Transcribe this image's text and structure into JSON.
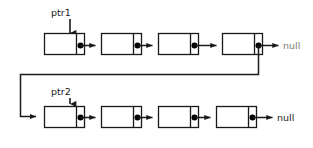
{
  "diagram": {
    "colors": {
      "background": "#ffffff",
      "stroke": "#1a1a1a",
      "node_fill": "#ffffff",
      "dot_fill": "#000000",
      "null_top_text": "#7d7d7d",
      "null_bottom_text": "#1a1a1a"
    },
    "rows": [
      {
        "name": "top-list",
        "pointer_label": "ptr1",
        "terminator_label": "null",
        "node_count": 4,
        "nodes": [
          {
            "data": "",
            "next": "node-2"
          },
          {
            "data": "",
            "next": "node-3"
          },
          {
            "data": "",
            "next": "node-4"
          },
          {
            "data": "",
            "next": "bottom-list-head"
          }
        ]
      },
      {
        "name": "bottom-list",
        "pointer_label": "ptr2",
        "terminator_label": "null",
        "node_count": 4,
        "nodes": [
          {
            "data": "",
            "next": "node-2"
          },
          {
            "data": "",
            "next": "node-3"
          },
          {
            "data": "",
            "next": "node-4"
          },
          {
            "data": "",
            "next": "null"
          }
        ]
      }
    ]
  }
}
